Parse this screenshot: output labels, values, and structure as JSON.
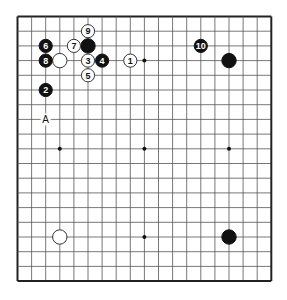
{
  "board": {
    "size": 19,
    "line_color": "#555555",
    "border_color": "#222222",
    "background": "#ffffff",
    "star_points": [
      [
        3,
        3
      ],
      [
        9,
        3
      ],
      [
        15,
        3
      ],
      [
        3,
        9
      ],
      [
        9,
        9
      ],
      [
        15,
        9
      ],
      [
        3,
        15
      ],
      [
        9,
        15
      ],
      [
        15,
        15
      ]
    ],
    "stones": [
      {
        "color": "black",
        "col": 5,
        "row": 2,
        "number": ""
      },
      {
        "color": "black",
        "col": 15,
        "row": 3,
        "number": ""
      },
      {
        "color": "black",
        "col": 15,
        "row": 15,
        "number": ""
      },
      {
        "color": "white",
        "col": 3,
        "row": 3,
        "number": ""
      },
      {
        "color": "white",
        "col": 3,
        "row": 15,
        "number": ""
      },
      {
        "color": "white",
        "col": 8,
        "row": 3,
        "number": "1"
      },
      {
        "color": "black",
        "col": 2,
        "row": 5,
        "number": "2"
      },
      {
        "color": "white",
        "col": 5,
        "row": 3,
        "number": "3"
      },
      {
        "color": "black",
        "col": 6,
        "row": 3,
        "number": "4"
      },
      {
        "color": "white",
        "col": 5,
        "row": 4,
        "number": "5"
      },
      {
        "color": "black",
        "col": 2,
        "row": 2,
        "number": "6"
      },
      {
        "color": "white",
        "col": 4,
        "row": 2,
        "number": "7"
      },
      {
        "color": "black",
        "col": 2,
        "row": 3,
        "number": "8"
      },
      {
        "color": "white",
        "col": 5,
        "row": 1,
        "number": "9"
      },
      {
        "color": "black",
        "col": 13,
        "row": 2,
        "number": "10"
      }
    ],
    "labels": [
      {
        "text": "A",
        "col": 2,
        "row": 7
      }
    ]
  }
}
